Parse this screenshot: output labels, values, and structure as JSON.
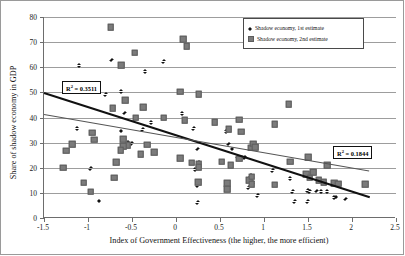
{
  "chart_data": {
    "type": "scatter",
    "title": "",
    "xlabel": "Index of Government Effectiveness (the higher, the more efficient)",
    "ylabel": "Share of shadow economy in GDP",
    "xlim": [
      -1.5,
      2.5
    ],
    "ylim": [
      0,
      80
    ],
    "xticks": [
      "-1.5",
      "-1",
      "-0.5",
      "0",
      "0.5",
      "1",
      "1.5",
      "2",
      "2.5"
    ],
    "xtick_values": [
      -1.5,
      -1,
      -0.5,
      0,
      0.5,
      1,
      1.5,
      2,
      2.5
    ],
    "yticks": [
      "0",
      "10",
      "20",
      "30",
      "40",
      "50",
      "60",
      "70",
      "80"
    ],
    "ytick_values": [
      0,
      10,
      20,
      30,
      40,
      50,
      60,
      70,
      80
    ],
    "grid": "horizontal",
    "legend_position": "top-right",
    "series": [
      {
        "name": "Shadow economy, 1st estimate",
        "marker": "diamond",
        "color": "#111111",
        "points": [
          [
            -1.1,
            60.6
          ],
          [
            -0.73,
            62.8
          ],
          [
            -0.35,
            58.2
          ],
          [
            -0.14,
            62.2
          ],
          [
            -0.8,
            49.0
          ],
          [
            -0.62,
            50.3
          ],
          [
            -0.58,
            41.6
          ],
          [
            -0.28,
            37.8
          ],
          [
            -1.12,
            35.6
          ],
          [
            -0.62,
            34.5
          ],
          [
            -0.38,
            35.2
          ],
          [
            0.07,
            41.4
          ],
          [
            0.2,
            35.5
          ],
          [
            0.57,
            34.2
          ],
          [
            0.6,
            29.4
          ],
          [
            0.64,
            27.4
          ],
          [
            0.7,
            24.1
          ],
          [
            0.78,
            24.0
          ],
          [
            0.25,
            27.4
          ],
          [
            0.26,
            22.0
          ],
          [
            -0.55,
            30.0
          ],
          [
            -0.5,
            29.5
          ],
          [
            -0.97,
            19.5
          ],
          [
            0.22,
            19.3
          ],
          [
            0.85,
            16.8
          ],
          [
            0.88,
            14.0
          ],
          [
            1.1,
            18.8
          ],
          [
            1.3,
            15.6
          ],
          [
            1.33,
            10.5
          ],
          [
            1.5,
            10.9
          ],
          [
            1.52,
            10.5
          ],
          [
            1.6,
            10.6
          ],
          [
            1.65,
            10.4
          ],
          [
            1.72,
            10.4
          ],
          [
            1.8,
            8.0
          ],
          [
            1.82,
            8.2
          ],
          [
            1.93,
            7.4
          ],
          [
            1.35,
            6.4
          ],
          [
            1.5,
            6.4
          ],
          [
            0.93,
            8.9
          ],
          [
            0.83,
            12.0
          ],
          [
            0.25,
            12.8
          ],
          [
            0.25,
            6.1
          ],
          [
            -0.87,
            6.7
          ]
        ]
      },
      {
        "name": "Shadow economy, 2nd estimate",
        "marker": "square",
        "color": "#7b7b7b",
        "points": [
          [
            -0.74,
            76.0
          ],
          [
            0.08,
            71.2
          ],
          [
            0.12,
            68.4
          ],
          [
            -0.47,
            65.8
          ],
          [
            -0.62,
            60.9
          ],
          [
            -0.72,
            43.6
          ],
          [
            -0.58,
            46.8
          ],
          [
            -0.46,
            40.0
          ],
          [
            -0.37,
            44.0
          ],
          [
            -0.14,
            40.0
          ],
          [
            0.05,
            50.2
          ],
          [
            0.26,
            49.3
          ],
          [
            0.1,
            38.9
          ],
          [
            0.44,
            38.2
          ],
          [
            0.6,
            35.4
          ],
          [
            0.72,
            39.1
          ],
          [
            0.74,
            34.3
          ],
          [
            1.12,
            37.4
          ],
          [
            1.28,
            45.3
          ],
          [
            -0.95,
            34.0
          ],
          [
            -0.93,
            31.2
          ],
          [
            -0.6,
            31.4
          ],
          [
            -0.55,
            29.0
          ],
          [
            -0.6,
            28.6
          ],
          [
            -0.33,
            29.2
          ],
          [
            -0.25,
            26.3
          ],
          [
            -0.4,
            25.3
          ],
          [
            -0.63,
            27.1
          ],
          [
            -0.68,
            22.2
          ],
          [
            -0.7,
            16.1
          ],
          [
            -1.25,
            26.8
          ],
          [
            -1.18,
            29.3
          ],
          [
            -1.28,
            20.0
          ],
          [
            -1.05,
            14.0
          ],
          [
            -0.97,
            10.4
          ],
          [
            0.05,
            23.7
          ],
          [
            0.18,
            22.0
          ],
          [
            0.26,
            21.4
          ],
          [
            0.26,
            20.3
          ],
          [
            0.52,
            22.4
          ],
          [
            0.62,
            20.9
          ],
          [
            0.85,
            27.9
          ],
          [
            0.88,
            29.6
          ],
          [
            0.9,
            28.1
          ],
          [
            1.3,
            22.4
          ],
          [
            1.5,
            24.2
          ],
          [
            1.72,
            21.0
          ],
          [
            0.58,
            13.8
          ],
          [
            0.58,
            11.5
          ],
          [
            0.25,
            14.3
          ],
          [
            0.83,
            15.0
          ],
          [
            0.86,
            13.5
          ],
          [
            1.12,
            13.3
          ],
          [
            1.48,
            17.5
          ],
          [
            1.56,
            18.3
          ],
          [
            1.52,
            16.0
          ],
          [
            1.62,
            15.0
          ],
          [
            1.68,
            14.2
          ],
          [
            1.8,
            13.9
          ],
          [
            1.84,
            13.6
          ],
          [
            2.15,
            13.5
          ],
          [
            0.86,
            16.5
          ],
          [
            0.72,
            23.6
          ]
        ]
      }
    ],
    "trendlines": [
      {
        "name": "1st estimate trend",
        "color": "#111111",
        "width": 2.2,
        "x_start": -1.5,
        "y_start": 50.0,
        "x_end": 2.2,
        "y_end": 8.5,
        "r_squared_label": "R² = 0.3511",
        "r_squared": 0.3511
      },
      {
        "name": "2nd estimate trend",
        "color": "#555555",
        "width": 1.1,
        "x_start": -1.5,
        "y_start": 41.5,
        "x_end": 2.2,
        "y_end": 19.0,
        "r_squared_label": "R² = 0.1844",
        "r_squared": 0.1844
      }
    ],
    "annotations": [
      {
        "name": "r2-box-1st",
        "text_prefix": "R",
        "text_sup": "2",
        "text_suffix": " = 0.3511",
        "x": 62,
        "y": 81
      },
      {
        "name": "r2-box-2nd",
        "text_prefix": "R",
        "text_sup": "2",
        "text_suffix": " = 0.1844",
        "x": 333,
        "y": 146
      }
    ]
  },
  "legend": {
    "items": [
      {
        "label": "Shadow economy, 1st estimate",
        "marker": "diamond"
      },
      {
        "label": "Shadow economy, 2nd estimate",
        "marker": "square"
      }
    ]
  }
}
